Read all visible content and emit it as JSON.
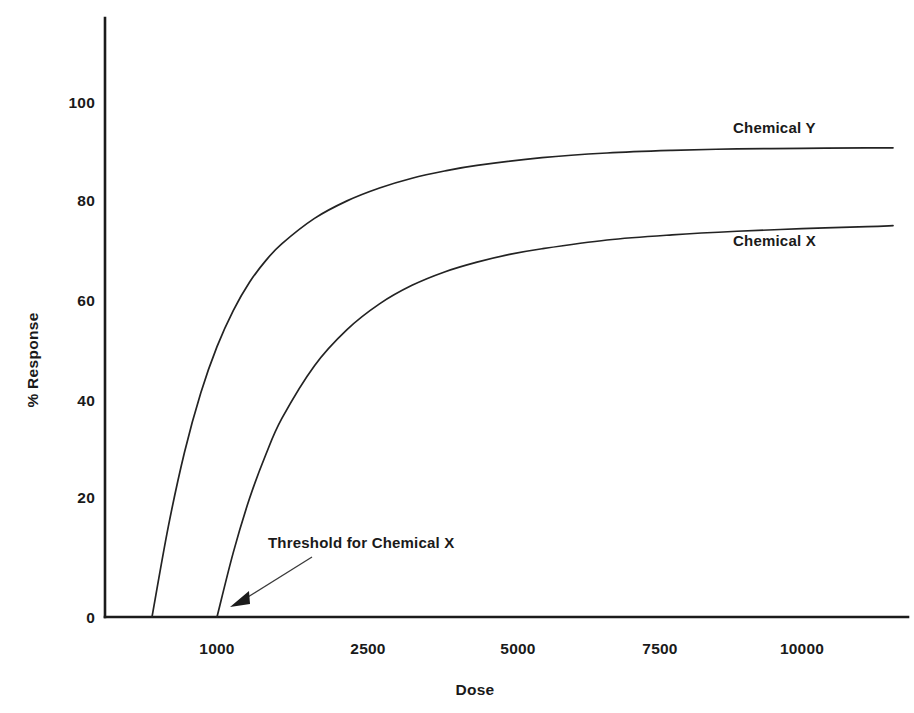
{
  "chart_data": {
    "type": "line",
    "title": "",
    "xlabel": "Dose",
    "ylabel": "% Response",
    "xlim": [
      0,
      11500
    ],
    "ylim": [
      0,
      115
    ],
    "grid": false,
    "legend_position": "inline-right-of-curve",
    "x_ticks": [
      {
        "value": 1000,
        "label": "1000"
      },
      {
        "value": 2500,
        "label": "2500"
      },
      {
        "value": 5000,
        "label": "5000"
      },
      {
        "value": 7500,
        "label": "7500"
      },
      {
        "value": 10000,
        "label": "10000"
      }
    ],
    "y_ticks": [
      {
        "value": 0,
        "label": "0"
      },
      {
        "value": 20,
        "label": "20"
      },
      {
        "value": 40,
        "label": "40"
      },
      {
        "value": 60,
        "label": "60"
      },
      {
        "value": 80,
        "label": "80"
      },
      {
        "value": 100,
        "label": "100"
      }
    ],
    "series": [
      {
        "name": "Chemical Y",
        "label": "Chemical Y",
        "threshold_dose": 0,
        "plateau": 91,
        "x": [
          0,
          250,
          500,
          750,
          1000,
          1250,
          1500,
          1750,
          2000,
          2500,
          3000,
          3500,
          4000,
          4500,
          5000,
          6000,
          7000,
          8000,
          9000,
          10000,
          11000,
          11400
        ],
        "y": [
          0,
          17.5,
          32.0,
          43.5,
          52.5,
          59.5,
          65.0,
          69.2,
          72.5,
          77.4,
          80.8,
          83.3,
          85.2,
          86.6,
          87.7,
          89.2,
          90.1,
          90.6,
          90.9,
          91.0,
          91.1,
          91.1
        ]
      },
      {
        "name": "Chemical X",
        "label": "Chemical X",
        "threshold_dose": 1000,
        "plateau": 76,
        "x": [
          1000,
          1250,
          1500,
          1750,
          2000,
          2500,
          3000,
          3500,
          4000,
          4500,
          5000,
          5500,
          6000,
          7000,
          8000,
          9000,
          10000,
          11000,
          11400
        ],
        "y": [
          0,
          12.5,
          23.0,
          31.5,
          38.6,
          48.8,
          55.8,
          60.8,
          64.4,
          67.0,
          68.9,
          70.4,
          71.5,
          73.2,
          74.2,
          74.9,
          75.4,
          75.8,
          76.0
        ]
      }
    ],
    "annotations": [
      {
        "text": "Threshold for Chemical X",
        "points_to_series": "Chemical X",
        "points_to_x": 1000,
        "points_to_y": 0
      }
    ]
  },
  "axes": {
    "y_axis_title": "% Response",
    "x_axis_title": "Dose"
  },
  "series_labels": {
    "y": "Chemical Y",
    "x": "Chemical X"
  },
  "annotation": {
    "threshold_text": "Threshold for Chemical X"
  },
  "colors": {
    "axis": "#1b1b1b",
    "curve": "#232323",
    "text": "#1a1a1a",
    "background": "#ffffff"
  }
}
